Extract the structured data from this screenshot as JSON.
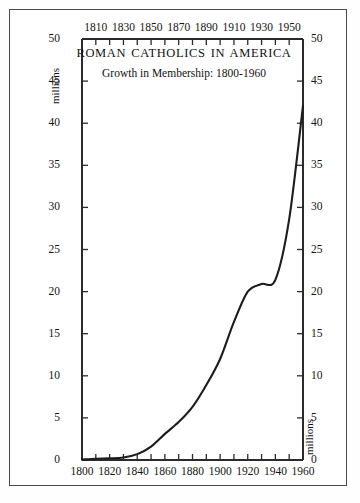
{
  "chart_data": {
    "type": "line",
    "title": "ROMAN CATHOLICS IN AMERICA",
    "subtitle": "Growth in Membership: 1800-1960",
    "xlabel": "",
    "ylabel": "millions",
    "ylabel_secondary": "millions",
    "xlim": [
      1800,
      1960
    ],
    "ylim": [
      0,
      50
    ],
    "grid": false,
    "legend": false,
    "x_axis_top_ticks": [
      1810,
      1830,
      1850,
      1870,
      1890,
      1910,
      1930,
      1950
    ],
    "x_axis_bottom_ticks": [
      1800,
      1820,
      1840,
      1860,
      1880,
      1900,
      1920,
      1940,
      1960
    ],
    "x_minor_tick_step": 10,
    "y_ticks": [
      0,
      5,
      10,
      15,
      20,
      25,
      30,
      35,
      40,
      45,
      50
    ],
    "x": [
      1800,
      1810,
      1820,
      1830,
      1840,
      1850,
      1860,
      1870,
      1880,
      1890,
      1900,
      1910,
      1920,
      1930,
      1940,
      1950,
      1960
    ],
    "values": [
      0.05,
      0.15,
      0.2,
      0.3,
      0.7,
      1.6,
      3.1,
      4.5,
      6.3,
      8.9,
      12.0,
      16.4,
      20.0,
      20.9,
      21.4,
      28.6,
      42.1
    ],
    "series": [
      {
        "name": "Roman Catholic membership",
        "values": [
          0.05,
          0.15,
          0.2,
          0.3,
          0.7,
          1.6,
          3.1,
          4.5,
          6.3,
          8.9,
          12.0,
          16.4,
          20.0,
          20.9,
          21.4,
          28.6,
          42.1
        ]
      }
    ],
    "line_color": "#1c1c1c",
    "axis_color": "#2b2b2b",
    "background_color": "#ffffff"
  },
  "axes": {
    "y_tick_labels_left": [
      "50",
      "45",
      "40",
      "35",
      "30",
      "25",
      "20",
      "15",
      "10",
      "5",
      "0"
    ],
    "y_tick_labels_right": [
      "50",
      "45",
      "40",
      "35",
      "30",
      "25",
      "20",
      "15",
      "10",
      "5",
      "0"
    ],
    "x_tick_labels_top": [
      "1810",
      "1830",
      "1850",
      "1870",
      "1890",
      "1910",
      "1930",
      "1950"
    ],
    "x_tick_labels_bottom": [
      "1800",
      "1820",
      "1840",
      "1860",
      "1880",
      "1900",
      "1920",
      "1940",
      "1960"
    ]
  },
  "annotations": {
    "millions_top_left": "millions",
    "millions_bottom_right": "millions"
  }
}
